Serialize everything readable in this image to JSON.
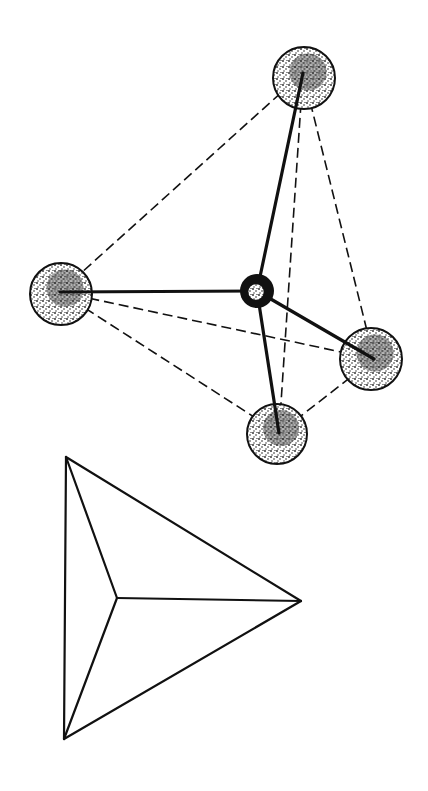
{
  "diagram": {
    "type": "tetrahedral-molecule",
    "colors": {
      "line": "#111111",
      "background": "#ffffff",
      "atom_fill": "#e6e6e6",
      "stipple": "#222222"
    },
    "central_atom": {
      "cx": 257,
      "cy": 291,
      "r": 17
    },
    "outer_atoms": [
      {
        "id": "top",
        "cx": 304,
        "cy": 78,
        "r": 31,
        "bond_end": [
          303,
          73
        ]
      },
      {
        "id": "left",
        "cx": 61,
        "cy": 294,
        "r": 31,
        "bond_end": [
          60,
          292
        ]
      },
      {
        "id": "right",
        "cx": 371,
        "cy": 359,
        "r": 31,
        "bond_end": [
          374,
          359
        ]
      },
      {
        "id": "bottom",
        "cx": 277,
        "cy": 434,
        "r": 30,
        "bond_end": [
          279,
          433
        ]
      }
    ],
    "dashed_edges": [
      [
        "top",
        "left"
      ],
      [
        "top",
        "right"
      ],
      [
        "top",
        "bottom"
      ],
      [
        "left",
        "right"
      ],
      [
        "left",
        "bottom"
      ],
      [
        "right",
        "bottom"
      ]
    ],
    "projection": {
      "vertices": {
        "top_left": [
          66,
          457
        ],
        "bottom_left": [
          64,
          739
        ],
        "right": [
          301,
          601
        ],
        "center": [
          117,
          598
        ]
      },
      "edges": [
        [
          "top_left",
          "bottom_left"
        ],
        [
          "top_left",
          "right"
        ],
        [
          "bottom_left",
          "right"
        ],
        [
          "center",
          "top_left"
        ],
        [
          "center",
          "bottom_left"
        ],
        [
          "center",
          "right"
        ]
      ]
    }
  }
}
